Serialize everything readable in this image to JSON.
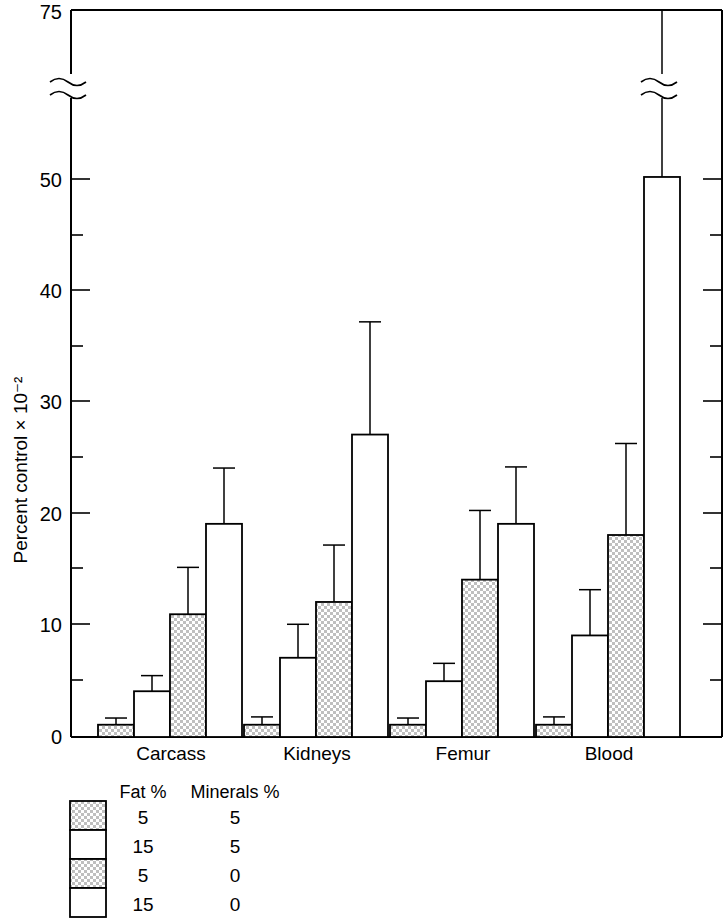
{
  "chart_data": {
    "type": "bar",
    "title": "",
    "xlabel": "",
    "ylabel": "Percent control × 10⁻²",
    "categories": [
      "Carcass",
      "Kidneys",
      "Femur",
      "Blood"
    ],
    "ylim": [
      0,
      75
    ],
    "y_ticks_major": [
      0,
      10,
      20,
      30,
      40,
      50,
      75
    ],
    "y_ticks_minor": [
      5,
      15,
      25,
      35,
      45
    ],
    "y_tick_labels": [
      "0",
      "10",
      "20",
      "30",
      "40",
      "50",
      "75"
    ],
    "axis_break": true,
    "axis_break_between": [
      50,
      75
    ],
    "grid": false,
    "legend_position": "below-left",
    "series": [
      {
        "name": "Fat 5% / Minerals 5%",
        "fill": "stipple",
        "values": [
          1.1,
          1.1,
          1.1,
          1.1
        ],
        "errors": [
          0.6,
          0.7,
          0.6,
          0.7
        ]
      },
      {
        "name": "Fat 15% / Minerals 5%",
        "fill": "white",
        "values": [
          4.1,
          7.1,
          5.0,
          9.1
        ],
        "errors": [
          1.4,
          3.0,
          1.6,
          4.1
        ]
      },
      {
        "name": "Fat 5% / Minerals 0%",
        "fill": "stipple",
        "values": [
          11.0,
          12.1,
          14.1,
          18.1
        ],
        "errors": [
          4.2,
          5.1,
          6.2,
          8.2
        ]
      },
      {
        "name": "Fat 15% / Minerals 0%",
        "fill": "white",
        "values": [
          19.1,
          27.1,
          19.1,
          50.3
        ],
        "errors": [
          5.0,
          10.1,
          5.1,
          24.7
        ]
      }
    ],
    "annotations": []
  },
  "axis": {
    "y_label": "Percent control × 10⁻²",
    "labels": [
      "75",
      "50",
      "40",
      "30",
      "20",
      "10",
      "0"
    ]
  },
  "groups": [
    {
      "label": "Carcass"
    },
    {
      "label": "Kidneys"
    },
    {
      "label": "Femur"
    },
    {
      "label": "Blood"
    }
  ],
  "legend": {
    "header_fat": "Fat  %",
    "header_minerals": "Minerals  %",
    "rows": [
      {
        "swatch": "stipple",
        "fat": "5",
        "minerals": "5"
      },
      {
        "swatch": "white",
        "fat": "15",
        "minerals": "5"
      },
      {
        "swatch": "stipple",
        "fat": "5",
        "minerals": "0"
      },
      {
        "swatch": "white",
        "fat": "15",
        "minerals": "0"
      }
    ]
  },
  "colors": {
    "line": "#000000",
    "background": "#ffffff",
    "stipple": "#c9c9c9"
  }
}
